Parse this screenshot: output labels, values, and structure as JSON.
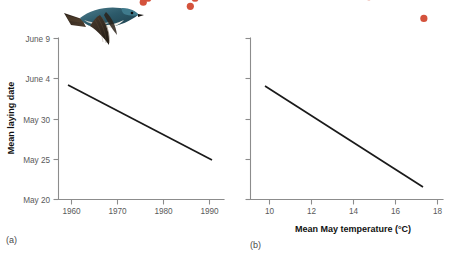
{
  "figure": {
    "caption_panel_a": "(a)",
    "caption_panel_b": "(b)",
    "marker_color": "#d4523c",
    "trend_color": "#1a1a1a",
    "axis_color": "#8c8c8c",
    "photo_alt": "tree-swallow-in-flight"
  },
  "chart_data": [
    {
      "type": "scatter",
      "panel": "(a)",
      "title": "",
      "xlabel": "",
      "ylabel": "Mean laying date",
      "xlim": [
        1957,
        1993
      ],
      "ylim": [
        0,
        20
      ],
      "grid": false,
      "legend": "none",
      "xticks": [
        1960,
        1970,
        1980,
        1990
      ],
      "xticklabels": [
        "1960",
        "1970",
        "1980",
        "1990"
      ],
      "yticks": [
        20,
        25,
        30,
        35,
        40
      ],
      "yticklabels": [
        "May 20",
        "May 25",
        "May 30",
        "June 4",
        "June 9"
      ],
      "ytick_note": "y axis is calendar date; May 20 = day 20, June 4 = day 35, June 9 = day 40",
      "x": [
        1961,
        1962,
        1966,
        1967,
        1967,
        1969,
        1969,
        1970,
        1971,
        1971,
        1972,
        1973,
        1975,
        1976,
        1977,
        1979,
        1980,
        1980,
        1981,
        1982,
        1983,
        1984,
        1985,
        1985,
        1986,
        1986,
        1987,
        1988,
        1989,
        1990,
        1990
      ],
      "y": [
        31.5,
        37.5,
        38.5,
        35.0,
        33.5,
        29.0,
        26.0,
        26.0,
        35.0,
        26.0,
        25.5,
        30.0,
        24.5,
        25.0,
        25.5,
        30.5,
        30.5,
        29.5,
        26.0,
        25.5,
        35.0,
        30.5,
        24.0,
        25.5,
        25.0,
        28.5,
        29.0,
        27.5,
        28.5,
        30.0,
        28.5
      ],
      "trendline": {
        "x": [
          1959.2,
          1990.5
        ],
        "y": [
          34.6,
          25.2
        ],
        "type": "linear-fit"
      }
    },
    {
      "type": "scatter",
      "panel": "(b)",
      "title": "",
      "xlabel": "Mean May temperature (°C)",
      "ylabel": "",
      "xlim": [
        9.0,
        18.2
      ],
      "ylim": [
        0,
        20
      ],
      "grid": false,
      "legend": "none",
      "xticks": [
        10,
        12,
        14,
        16,
        18
      ],
      "xticklabels": [
        "10",
        "12",
        "14",
        "16",
        "18"
      ],
      "yticks": [
        20,
        25,
        30,
        35,
        40
      ],
      "yticklabels": [
        "",
        "",
        "",
        "",
        ""
      ],
      "ytick_note": "same date scale as panel (a), tick marks unlabeled",
      "x": [
        9.9,
        10.3,
        10.5,
        10.2,
        10.8,
        11.1,
        11.4,
        9.8,
        10.9,
        11.2,
        11.3,
        11.6,
        10.1,
        12.2,
        12.4,
        12.3,
        12.2,
        13.5,
        13.6,
        13.5,
        13.6,
        13.5,
        13.3,
        14.6,
        14.9,
        15.1,
        15.2,
        17.2,
        12.1,
        11.5,
        13.4
      ],
      "y": [
        37.8,
        38.2,
        38.6,
        35.8,
        35.3,
        35.6,
        35.8,
        33.4,
        32.8,
        31.0,
        30.9,
        31.3,
        30.7,
        30.6,
        30.4,
        28.7,
        27.6,
        30.7,
        29.6,
        29.0,
        28.5,
        27.6,
        26.7,
        25.2,
        26.2,
        26.1,
        25.3,
        22.5,
        30.2,
        30.9,
        28.3
      ],
      "trendline": {
        "x": [
          9.75,
          17.3
        ],
        "y": [
          34.7,
          22.4
        ],
        "type": "linear-fit"
      }
    }
  ]
}
